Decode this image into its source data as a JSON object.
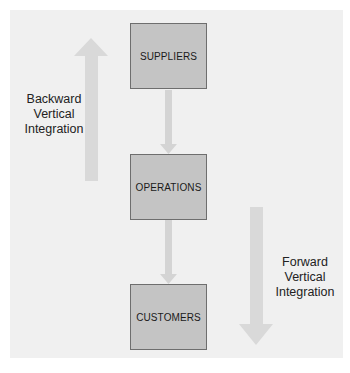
{
  "diagram": {
    "nodes": [
      {
        "id": "suppliers",
        "label": "SUPPLIERS"
      },
      {
        "id": "operations",
        "label": "OPERATIONS"
      },
      {
        "id": "customers",
        "label": "CUSTOMERS"
      }
    ],
    "edges": [
      {
        "from": "suppliers",
        "to": "operations"
      },
      {
        "from": "operations",
        "to": "customers"
      }
    ],
    "backward": {
      "line1": "Backward",
      "line2": "Vertical",
      "line3": "Integration",
      "direction": "up"
    },
    "forward": {
      "line1": "Forward",
      "line2": "Vertical",
      "line3": "Integration",
      "direction": "down"
    },
    "colors": {
      "box": "#c4c4c4",
      "box_border": "#6e6e6e",
      "arrow": "#d8d8d8",
      "panel": "#f0f0f0"
    }
  }
}
